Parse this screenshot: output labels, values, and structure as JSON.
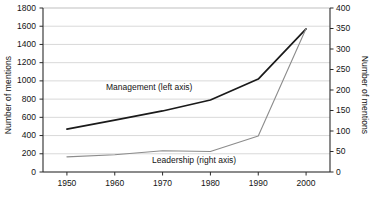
{
  "chart_data": {
    "type": "line",
    "title": "",
    "xlabel": "",
    "ylabel": "Number of mentions",
    "ylabel_right": "Number of mentions",
    "grid": true,
    "legend_position": "inline-annotation",
    "x": [
      1950,
      1960,
      1970,
      1980,
      1990,
      2000
    ],
    "xtick_labels": [
      "1950",
      "1960",
      "1970",
      "1980",
      "1990",
      "2000"
    ],
    "xlim": [
      1945,
      2005
    ],
    "ylim": [
      0,
      1800
    ],
    "ytick_labels": [
      "0",
      "200",
      "400",
      "600",
      "800",
      "1000",
      "1200",
      "1400",
      "1600",
      "1800"
    ],
    "ytick_values": [
      0,
      200,
      400,
      600,
      800,
      1000,
      1200,
      1400,
      1600,
      1800
    ],
    "ylim_right": [
      0,
      400
    ],
    "ytick_labels_right": [
      "0",
      "50",
      "100",
      "150",
      "200",
      "250",
      "300",
      "350",
      "400"
    ],
    "ytick_values_right": [
      0,
      50,
      100,
      150,
      200,
      250,
      300,
      350,
      400
    ],
    "series": [
      {
        "name": "Management (left axis)",
        "axis": "left",
        "color": "#1a1a1a",
        "values": [
          470,
          570,
          670,
          790,
          1020,
          1570
        ]
      },
      {
        "name": "Leadership (right axis)",
        "axis": "right",
        "color": "#8c8c8c",
        "values": [
          37,
          42,
          52,
          50,
          88,
          350
        ]
      }
    ],
    "annotations": [
      {
        "text": "Management (left axis)",
        "series": "Management (left axis)"
      },
      {
        "text": "Leadership (right axis)",
        "series": "Leadership (right axis)"
      }
    ]
  },
  "colors": {
    "management_line": "#1a1a1a",
    "leadership_line": "#8c8c8c",
    "grid": "#c9c9c9",
    "axis": "#2b2b2b",
    "background": "#ffffff"
  }
}
